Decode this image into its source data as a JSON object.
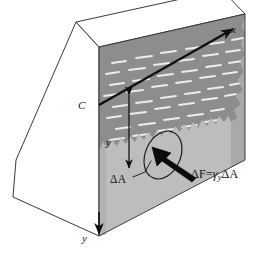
{
  "figure": {
    "background_color": "#ffffff",
    "line_color": "#1a1a1a"
  },
  "labels": {
    "x_axis": "x",
    "y_axis": "y",
    "centroid": "C",
    "depth": "y",
    "element_area": "ΔA",
    "force_equation": {
      "delta_f": "ΔF",
      "equals": "=",
      "gamma": "γ",
      "gamma_subscript": "y",
      "delta_a": "ΔA"
    }
  },
  "geometry": {
    "front_face_color": "#bdbdbd",
    "top_face_color": "#ffffff",
    "side_face_color": "#ffffff",
    "water_region_color": "#8a8a8a",
    "water_dash_color": "#ededed",
    "right_edge_face_color": "#a8a8a8",
    "outline_color": "#1e1e1e",
    "axis_line_color": "#111111",
    "arrow_color": "#0d0d0d",
    "ellipse_color": "#141414"
  },
  "annotations": {
    "depth_arrow": "double-headed vertical arrow marking depth y",
    "force_arrow": "thick arrow showing force on element",
    "callout_leader": "leader line from ΔA label to element",
    "ellipse_highlight": "tilted ellipse highlighting element of area"
  }
}
